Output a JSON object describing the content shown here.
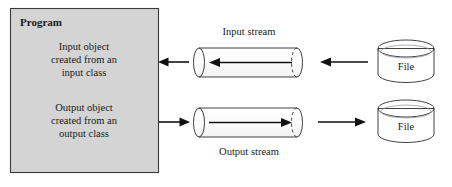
{
  "figure": {
    "type": "block-diagram",
    "title_label": "Program",
    "background_color": "#ffffff",
    "box_fill_color": "#d4d4d4",
    "cylinder_fill_color": "#d9d9d9",
    "stroke_color": "#2b2b2b"
  },
  "program_box": {
    "label": "Program",
    "input_object_line1": "Input object",
    "input_object_line2": "created from an",
    "input_object_line3": "input class",
    "output_object_line1": "Output object",
    "output_object_line2": "created from an",
    "output_object_line3": "output class"
  },
  "streams": {
    "input_label": "Input stream",
    "output_label": "Output stream"
  },
  "files": {
    "top_label": "File",
    "bottom_label": "File"
  },
  "arrows": {
    "input_to_program_direction": "left",
    "file_to_input_stream_direction": "left",
    "program_to_output_direction": "right",
    "output_stream_to_file_direction": "right",
    "inside_input_stream_direction": "left",
    "inside_output_stream_direction": "right"
  }
}
